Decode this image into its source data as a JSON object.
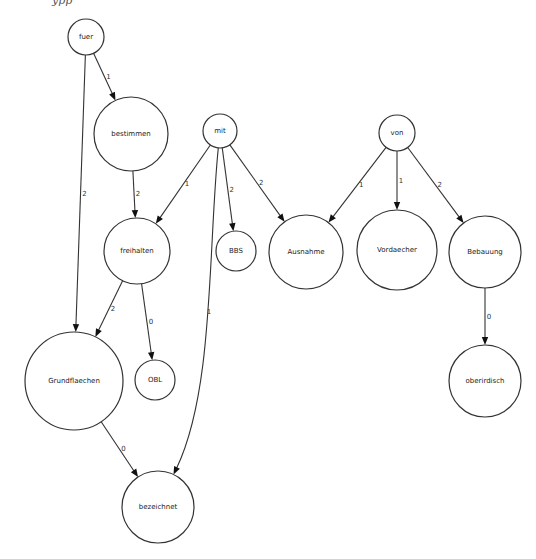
{
  "header": {
    "cut_off_text": "ypp"
  },
  "graph": {
    "nodes": [
      {
        "id": "fuer",
        "label": "fuer"
      },
      {
        "id": "bestimmen",
        "label": "bestimmen"
      },
      {
        "id": "mit",
        "label": "mit"
      },
      {
        "id": "von",
        "label": "von"
      },
      {
        "id": "freihalten",
        "label": "freihalten"
      },
      {
        "id": "BBS",
        "label": "BBS"
      },
      {
        "id": "Ausnahme",
        "label": "Ausnahme"
      },
      {
        "id": "Vordaecher",
        "label": "Vordaecher"
      },
      {
        "id": "Bebauung",
        "label": "Bebauung"
      },
      {
        "id": "Grundflaechen",
        "label": "Grundflaechen"
      },
      {
        "id": "OBL",
        "label": "OBL"
      },
      {
        "id": "oberirdisch",
        "label": "oberirdisch"
      },
      {
        "id": "bezeichnet",
        "label": "bezeichnet"
      }
    ],
    "edges": [
      {
        "from": "fuer",
        "to": "bestimmen",
        "label": "1"
      },
      {
        "from": "fuer",
        "to": "Grundflaechen",
        "label": "2"
      },
      {
        "from": "bestimmen",
        "to": "freihalten",
        "label": "2"
      },
      {
        "from": "mit",
        "to": "freihalten",
        "label": "1"
      },
      {
        "from": "mit",
        "to": "BBS",
        "label": "2"
      },
      {
        "from": "mit",
        "to": "Ausnahme",
        "label": "2"
      },
      {
        "from": "mit",
        "to": "bezeichnet",
        "label": "1"
      },
      {
        "from": "von",
        "to": "Ausnahme",
        "label": "1"
      },
      {
        "from": "von",
        "to": "Vordaecher",
        "label": "1"
      },
      {
        "from": "von",
        "to": "Bebauung",
        "label": "2"
      },
      {
        "from": "freihalten",
        "to": "Grundflaechen",
        "label": "2"
      },
      {
        "from": "freihalten",
        "to": "OBL",
        "label": "0"
      },
      {
        "from": "Grundflaechen",
        "to": "bezeichnet",
        "label": "0"
      },
      {
        "from": "Bebauung",
        "to": "oberirdisch",
        "label": "0"
      }
    ]
  }
}
